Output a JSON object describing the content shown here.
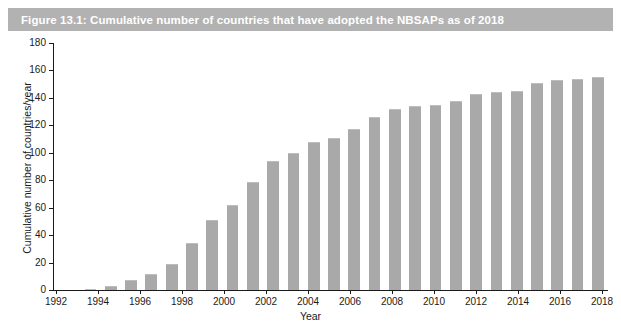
{
  "title_bar": {
    "text": "Figure 13.1: Cumulative number of countries that have adopted the NBSAPs as of 2018",
    "background_color": "#b2b2b2",
    "text_color": "#ffffff"
  },
  "chart_data": {
    "type": "bar",
    "title": "Figure 13.1: Cumulative number of countries that have adopted the NBSAPs as of 2018",
    "xlabel": "Year",
    "ylabel": "Cumulative number of countries/year",
    "bar_color": "#a9a9a9",
    "grid": false,
    "legend": null,
    "ylim": [
      0,
      180
    ],
    "yticks": [
      0,
      20,
      40,
      60,
      80,
      100,
      120,
      140,
      160,
      180
    ],
    "xtick_labels": [
      "1992",
      "1994",
      "1996",
      "1998",
      "2000",
      "2002",
      "2004",
      "2006",
      "2008",
      "2010",
      "2012",
      "2014",
      "2016",
      "2018"
    ],
    "xlim": [
      1992,
      2018
    ],
    "categories": [
      1993,
      1994,
      1995,
      1996,
      1997,
      1998,
      1999,
      2000,
      2001,
      2002,
      2003,
      2004,
      2005,
      2006,
      2007,
      2008,
      2009,
      2010,
      2011,
      2012,
      2013,
      2014,
      2015,
      2016,
      2017,
      2018
    ],
    "values": [
      1,
      3,
      7,
      12,
      19,
      34,
      51,
      62,
      79,
      94,
      100,
      108,
      111,
      117,
      126,
      132,
      134,
      135,
      138,
      143,
      144,
      145,
      151,
      153,
      154,
      155
    ]
  }
}
